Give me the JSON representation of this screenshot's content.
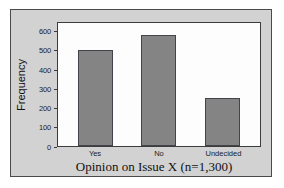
{
  "chart_data": {
    "type": "bar",
    "title": "",
    "categories": [
      "Yes",
      "No",
      "Undecided"
    ],
    "values": [
      500,
      575,
      250
    ],
    "xlabel": "Opinion on Issue X (n=1,300)",
    "ylabel": "Frequency",
    "ylim": [
      0,
      650
    ],
    "yticks": [
      0,
      100,
      200,
      300,
      400,
      500,
      600
    ],
    "ytick_labels": [
      "0",
      "100",
      "200",
      "300",
      "400",
      "500",
      "600"
    ],
    "grid": false,
    "legend": null,
    "bar_color": "#848484",
    "bar_edge_color": "#43434a",
    "plot_background": "#fdfdfd",
    "figure_background": "#d2d2d2",
    "frame_color": "#3c3c3c"
  }
}
